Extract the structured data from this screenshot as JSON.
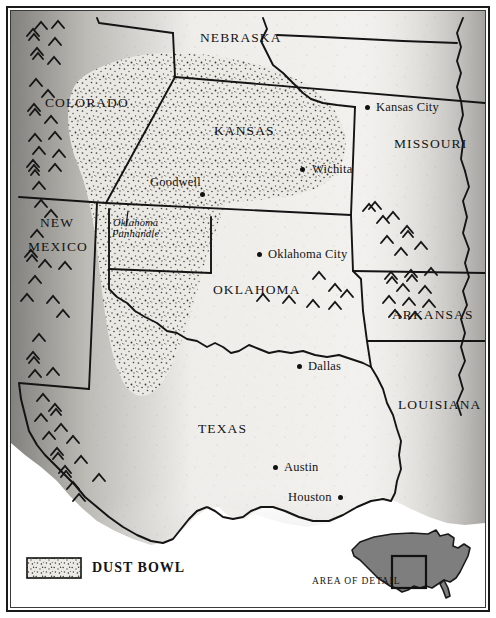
{
  "map": {
    "title": "Dust Bowl region map",
    "states": [
      {
        "name": "COLORADO",
        "x": 45,
        "y": 96,
        "lines": [
          "COLORADO"
        ]
      },
      {
        "name": "NEBRASKA",
        "x": 200,
        "y": 31,
        "lines": [
          "NEBRASKA"
        ]
      },
      {
        "name": "KANSAS",
        "x": 214,
        "y": 124,
        "lines": [
          "KANSAS"
        ]
      },
      {
        "name": "MISSOURI",
        "x": 394,
        "y": 137,
        "lines": [
          "MISSOURI"
        ]
      },
      {
        "name": "NEW MEXICO",
        "x": 32,
        "y": 216,
        "lines": [
          "NEW",
          "MEXICO"
        ]
      },
      {
        "name": "OKLAHOMA",
        "x": 213,
        "y": 283,
        "lines": [
          "OKLAHOMA"
        ]
      },
      {
        "name": "ARKANSAS",
        "x": 392,
        "y": 308,
        "lines": [
          "ARKANSAS"
        ]
      },
      {
        "name": "TEXAS",
        "x": 198,
        "y": 422,
        "lines": [
          "TEXAS"
        ]
      },
      {
        "name": "LOUISIANA",
        "x": 398,
        "y": 398,
        "lines": [
          "LOUISIANA"
        ]
      }
    ],
    "cities": [
      {
        "name": "Kansas City",
        "label_x": 376,
        "label_y": 101,
        "dot_x": 365,
        "dot_y": 105,
        "label_side": "right"
      },
      {
        "name": "Wichita",
        "label_x": 312,
        "label_y": 163,
        "dot_x": 300,
        "dot_y": 167,
        "label_side": "right"
      },
      {
        "name": "Goodwell",
        "label_x": 150,
        "label_y": 176,
        "dot_x": 200,
        "dot_y": 192,
        "label_side": "left"
      },
      {
        "name": "Oklahoma City",
        "label_x": 268,
        "label_y": 248,
        "dot_x": 257,
        "dot_y": 252,
        "label_side": "right"
      },
      {
        "name": "Dallas",
        "label_x": 308,
        "label_y": 360,
        "dot_x": 297,
        "dot_y": 364,
        "label_side": "right"
      },
      {
        "name": "Austin",
        "label_x": 284,
        "label_y": 461,
        "dot_x": 273,
        "dot_y": 465,
        "label_side": "right"
      },
      {
        "name": "Houston",
        "label_x": 288,
        "label_y": 491,
        "dot_x": 338,
        "dot_y": 495,
        "label_side": "left"
      }
    ],
    "annotations": [
      {
        "name": "oklahoma-panhandle",
        "text_line1": "Oklahoma",
        "text_line2": "Panhandle",
        "x": 112,
        "y": 217
      }
    ]
  },
  "legend": {
    "swatch_label": "DUST BOWL",
    "swatch_name": "dust-bowl-swatch",
    "label_x": 92,
    "label_y": 561
  },
  "inset": {
    "label": "AREA OF DETAIL",
    "label_x": 312,
    "label_y": 577,
    "landmass_fill": "#7e7e7e",
    "detail_box_stroke": "#111111"
  },
  "colors": {
    "land_light": "#f2f1ee",
    "land_shade": "#8e8d8a",
    "ink": "#141414",
    "stipple": "#4a4a4a",
    "paper": "#ffffff",
    "inset_gray": "#7e7e7e"
  },
  "symbols": {
    "mountain_chevron": "mountain-range-chevron",
    "city_dot": "city-dot"
  }
}
